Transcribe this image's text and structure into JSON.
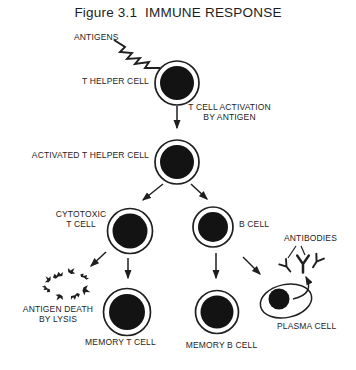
{
  "figure_title": "Figure 3.1  IMMUNE RESPONSE",
  "nodes": {
    "antigens": "ANTIGENS",
    "t_helper_cell": "T HELPER CELL",
    "activation": {
      "line1": "T CELL ACTIVATION",
      "line2": "BY ANTIGEN"
    },
    "activated_t_helper_cell": "ACTIVATED T HELPER CELL",
    "cytotoxic_t_cell": {
      "line1": "CYTOTOXIC",
      "line2": "T CELL"
    },
    "b_cell": "B CELL",
    "antibodies": "ANTIBODIES",
    "antigen_death": {
      "line1": "ANTIGEN DEATH",
      "line2": "BY LYSIS"
    },
    "memory_t_cell": "MEMORY T CELL",
    "memory_b_cell": "MEMORY B CELL",
    "plasma_cell": "PLASMA CELL"
  },
  "colors": {
    "ink": "#1f1f1f",
    "cell_fill": "#131313",
    "background": "#ffffff"
  }
}
